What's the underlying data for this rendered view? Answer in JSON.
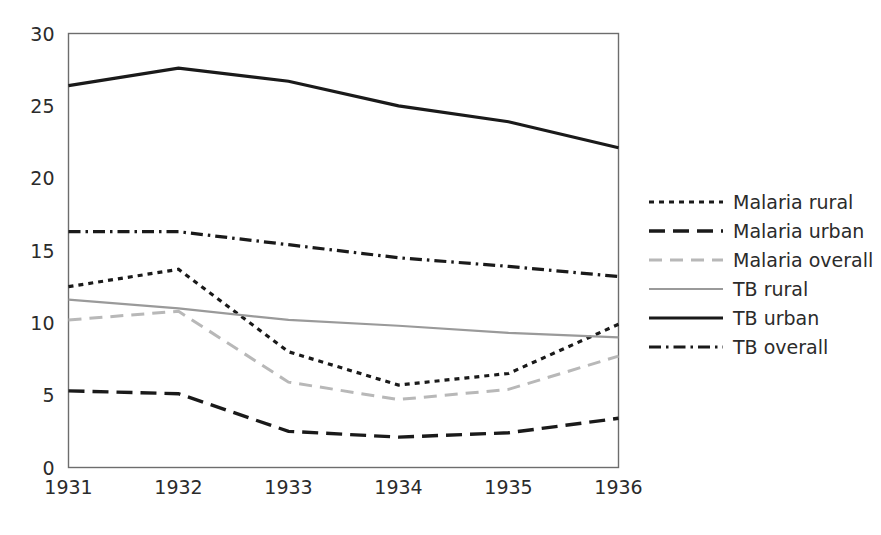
{
  "chart_data": {
    "type": "line",
    "title": "",
    "xlabel": "",
    "ylabel": "",
    "categories": [
      "1931",
      "1932",
      "1933",
      "1934",
      "1935",
      "1936"
    ],
    "x_tick_labels": [
      "1931",
      "1932",
      "1933",
      "1934",
      "1935",
      "1936"
    ],
    "y_tick_labels": [
      "0",
      "5",
      "10",
      "15",
      "20",
      "25",
      "30"
    ],
    "y_ticks": [
      0,
      5,
      10,
      15,
      20,
      25,
      30
    ],
    "ylim": [
      0,
      30
    ],
    "xlim": [
      "1931",
      "1936"
    ],
    "grid": false,
    "legend_position": "right",
    "series": [
      {
        "name": "Malaria rural",
        "values": [
          12.5,
          13.7,
          8.0,
          5.7,
          6.5,
          9.9
        ],
        "color": "#1a1a1a",
        "style": "dotted",
        "dasharray": "5,5",
        "width": 3.2
      },
      {
        "name": "Malaria urban",
        "values": [
          5.3,
          5.1,
          2.5,
          2.1,
          2.4,
          3.4
        ],
        "color": "#1a1a1a",
        "style": "dashed",
        "dasharray": "16,8",
        "width": 3.4
      },
      {
        "name": "Malaria overall",
        "values": [
          10.2,
          10.8,
          5.9,
          4.7,
          5.4,
          7.7
        ],
        "color": "#b8b8b8",
        "style": "dashed",
        "dasharray": "13,8",
        "width": 3.0
      },
      {
        "name": "TB rural",
        "values": [
          11.6,
          11.0,
          10.2,
          9.8,
          9.3,
          9.0
        ],
        "color": "#9a9a9a",
        "style": "solid",
        "dasharray": "none",
        "width": 2.2
      },
      {
        "name": "TB urban",
        "values": [
          26.4,
          27.6,
          26.7,
          25.0,
          23.9,
          22.1
        ],
        "color": "#1a1a1a",
        "style": "solid",
        "dasharray": "none",
        "width": 3.2
      },
      {
        "name": "TB overall",
        "values": [
          16.3,
          16.3,
          15.4,
          14.5,
          13.9,
          13.2
        ],
        "color": "#1a1a1a",
        "style": "dash-dot",
        "dasharray": "12,5,2.5,5",
        "width": 3.2
      }
    ]
  },
  "legend": {
    "items": [
      {
        "label": "Malaria rural"
      },
      {
        "label": "Malaria urban"
      },
      {
        "label": "Malaria overall"
      },
      {
        "label": "TB rural"
      },
      {
        "label": "TB urban"
      },
      {
        "label": "TB overall"
      }
    ]
  },
  "plot": {
    "border_color": "#6d6d6d",
    "background": "#ffffff"
  }
}
